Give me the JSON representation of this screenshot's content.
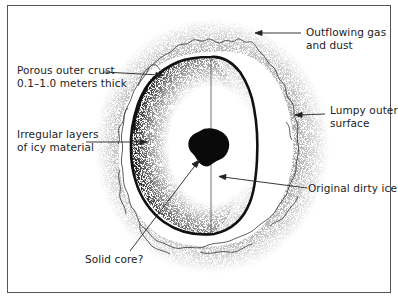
{
  "diagram": {
    "type": "comet-nucleus-cross-section",
    "colors": {
      "ink": "#1a1a1a",
      "frame": "#555555",
      "stipple": "#444444",
      "background": "#ffffff"
    },
    "labels": {
      "porous_crust": {
        "line1": "Porous outer crust",
        "line2": "0.1–1.0 meters thick"
      },
      "irregular_layers": {
        "line1": "Irregular layers",
        "line2": "of icy material"
      },
      "outflowing_gas": {
        "line1": "Outflowing gas",
        "line2": "and dust"
      },
      "lumpy_surface": {
        "line1": "Lumpy outer",
        "line2": "surface"
      },
      "dirty_ice": {
        "line1": "Original dirty ice"
      },
      "solid_core": {
        "line1": "Solid core?"
      }
    },
    "icons": {
      "core": "solid-core-blob",
      "arrows": "arrow-pointer"
    }
  }
}
